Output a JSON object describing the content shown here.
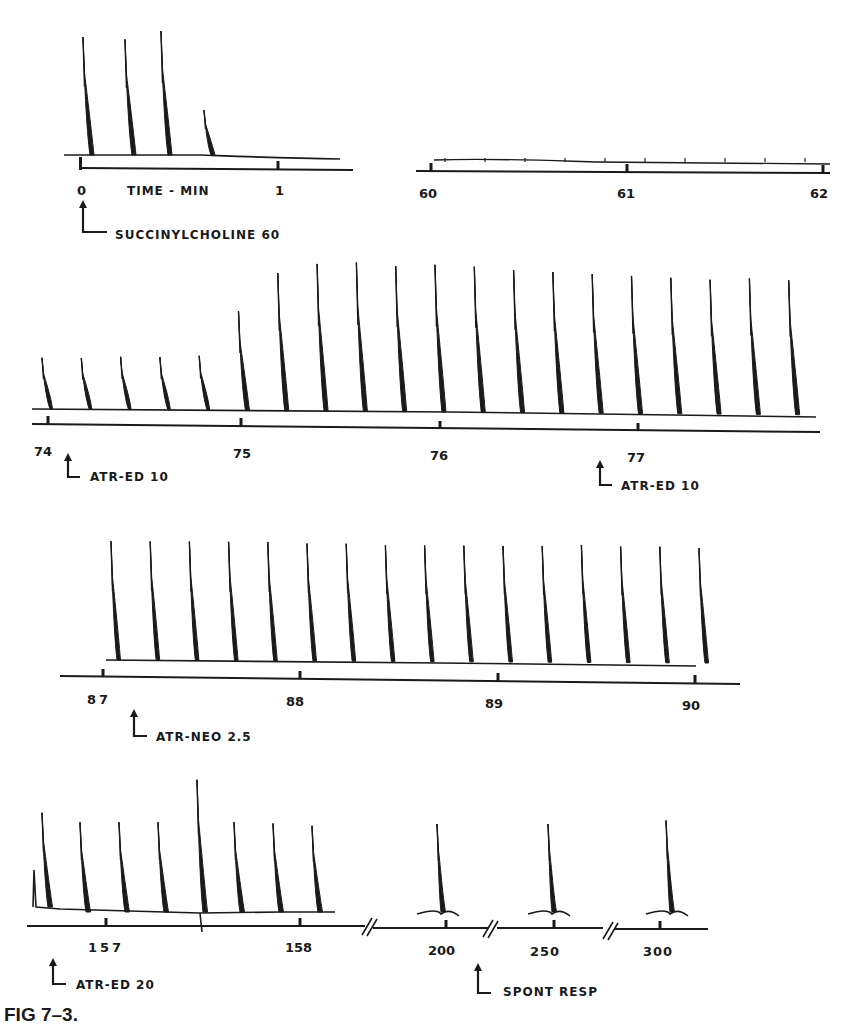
{
  "figure": {
    "caption": "FIG 7–3.",
    "ink_color": "#1a1a1a",
    "background": "#ffffff"
  },
  "chart_data": {
    "type": "line",
    "title": "FIG 7–3.",
    "xlabel": "TIME - MIN",
    "ylabel": "",
    "grid": false,
    "legend": null,
    "panels": [
      {
        "id": "panel-1a",
        "time_ticks": [
          "0",
          "1"
        ],
        "axis_label": "TIME - MIN",
        "x_range": [
          0,
          1.2
        ],
        "twitch_heights_relative": [
          1.0,
          0.98,
          1.05,
          0.38
        ],
        "annotations": [
          {
            "label": "SUCCINYLCHOLINE 60",
            "at_min": 0
          }
        ]
      },
      {
        "id": "panel-1b",
        "time_ticks": [
          "60",
          "61",
          "62"
        ],
        "x_range": [
          60,
          62
        ],
        "twitch_heights_relative": [
          0.03,
          0.03,
          0.03,
          0.05,
          0.03,
          0.03,
          0.03,
          0.03,
          0.03,
          0.03
        ],
        "annotations": []
      },
      {
        "id": "panel-2",
        "time_ticks": [
          "74",
          "75",
          "76",
          "77"
        ],
        "x_range": [
          74,
          77.8
        ],
        "twitch_heights_relative": [
          0.32,
          0.32,
          0.33,
          0.33,
          0.34,
          0.62,
          0.86,
          0.92,
          0.93,
          0.91,
          0.92,
          0.91,
          0.89,
          0.88,
          0.87,
          0.86,
          0.85,
          0.84,
          0.85,
          0.84
        ],
        "annotations": [
          {
            "label": "ATR-ED 10",
            "at_min": 74.15
          },
          {
            "label": "ATR-ED 10",
            "at_min": 76.8
          }
        ]
      },
      {
        "id": "panel-3",
        "time_ticks": [
          "87",
          "88",
          "89",
          "90"
        ],
        "x_range": [
          86.9,
          90.1
        ],
        "twitch_heights_relative": [
          0.88,
          0.88,
          0.88,
          0.88,
          0.88,
          0.87,
          0.87,
          0.86,
          0.86,
          0.86,
          0.86,
          0.86,
          0.87,
          0.86,
          0.86,
          0.85
        ],
        "annotations": [
          {
            "label": "ATR-NEO 2.5",
            "at_min": 87.1
          }
        ]
      },
      {
        "id": "panel-4",
        "time_ticks": [
          "157",
          "158",
          "200",
          "250",
          "300"
        ],
        "axis_breaks": [
          3
        ],
        "twitch_heights_relative": [
          0.82,
          0.78,
          0.78,
          0.78,
          1.0,
          0.78,
          0.77,
          0.75,
          0.75,
          0.75,
          0.78
        ],
        "annotations": [
          {
            "label": "ATR-ED 20",
            "at_min": 156.8
          },
          {
            "label": "SPONT RESP",
            "at_min": 215
          }
        ]
      }
    ]
  },
  "labels": {
    "time_axis": "TIME - MIN",
    "succinylcholine": "SUCCINYLCHOLINE 60",
    "atr_ed_10_a": "ATR-ED 10",
    "atr_ed_10_b": "ATR-ED 10",
    "atr_neo": "ATR-NEO 2.5",
    "atr_ed_20": "ATR-ED 20",
    "spont_resp": "SPONT RESP",
    "ticks": {
      "p1a": [
        "0",
        "1"
      ],
      "p1b": [
        "60",
        "61",
        "62"
      ],
      "p2": [
        "74",
        "75",
        "76",
        "77"
      ],
      "p3": [
        "87",
        "88",
        "89",
        "90"
      ],
      "p4": [
        "157",
        "158",
        "200",
        "250",
        "300"
      ]
    }
  }
}
